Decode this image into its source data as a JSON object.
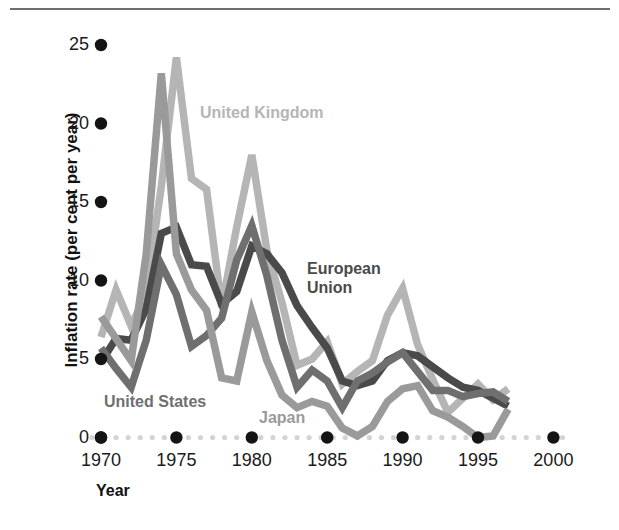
{
  "figure": {
    "top_rule": true,
    "background": "#ffffff"
  },
  "axes": {
    "ylabel": "Inflation rate (per cent per year)",
    "xlabel": "Year",
    "yticks": [
      0,
      5,
      10,
      15,
      20,
      25
    ],
    "xticks": [
      1970,
      1975,
      1980,
      1985,
      1990,
      1995,
      2000
    ],
    "ylim": [
      0,
      27.5
    ],
    "xlim": [
      1969.3,
      2001.5
    ],
    "tick_dot_color": "#141414",
    "minor_dot_color": "#d4d4d4"
  },
  "series_labels": [
    {
      "name": "united-kingdom",
      "text": "United Kingdom",
      "color": "#b5b5b5",
      "x": 200,
      "y": 103
    },
    {
      "name": "european-union",
      "text": "European\nUnion",
      "color": "#4a4a4a",
      "x": 307,
      "y": 259
    },
    {
      "name": "united-states",
      "text": "United States",
      "color": "#6f6f6f",
      "x": 104,
      "y": 392
    },
    {
      "name": "japan",
      "text": "Japan",
      "color": "#9a9a9a",
      "x": 259,
      "y": 408
    }
  ],
  "chart_data": {
    "type": "line",
    "title": "",
    "xlabel": "Year",
    "ylabel": "Inflation rate (per cent per year)",
    "xlim": [
      1969.3,
      2001.5
    ],
    "ylim": [
      0,
      27.5
    ],
    "xticks": [
      1970,
      1975,
      1980,
      1985,
      1990,
      1995,
      2000
    ],
    "yticks": [
      0,
      5,
      10,
      15,
      20,
      25
    ],
    "grid": false,
    "legend": "inline-annotations",
    "x": [
      1970,
      1971,
      1972,
      1973,
      1974,
      1975,
      1976,
      1977,
      1978,
      1979,
      1980,
      1981,
      1982,
      1983,
      1984,
      1985,
      1986,
      1987,
      1988,
      1989,
      1990,
      1991,
      1992,
      1993,
      1994,
      1995,
      1996,
      1997
    ],
    "series": [
      {
        "name": "United Kingdom",
        "color": "#b5b5b5",
        "values": [
          6.4,
          9.4,
          7.1,
          9.2,
          16.0,
          24.2,
          16.5,
          15.8,
          8.3,
          13.4,
          18.0,
          11.9,
          8.6,
          4.6,
          5.0,
          6.1,
          3.4,
          4.2,
          4.9,
          7.8,
          9.5,
          5.9,
          3.7,
          1.6,
          2.5,
          3.4,
          2.4,
          3.1
        ]
      },
      {
        "name": "European Union",
        "color": "#4a4a4a",
        "values": [
          4.8,
          6.3,
          6.2,
          8.2,
          13.0,
          13.4,
          11.0,
          10.9,
          8.5,
          9.3,
          12.2,
          11.7,
          10.5,
          8.4,
          7.0,
          5.7,
          3.6,
          3.3,
          3.6,
          4.9,
          5.4,
          5.2,
          4.5,
          3.8,
          3.2,
          3.0,
          2.5,
          2.0
        ]
      },
      {
        "name": "United States",
        "color": "#6f6f6f",
        "values": [
          5.7,
          4.4,
          3.2,
          6.2,
          11.0,
          9.1,
          5.8,
          6.5,
          7.6,
          11.3,
          13.5,
          10.3,
          6.2,
          3.2,
          4.3,
          3.6,
          1.9,
          3.6,
          4.1,
          4.8,
          5.4,
          4.2,
          3.0,
          3.0,
          2.6,
          2.8,
          2.9,
          2.3
        ]
      },
      {
        "name": "Japan",
        "color": "#9a9a9a",
        "values": [
          7.7,
          6.3,
          4.9,
          11.7,
          23.2,
          11.7,
          9.4,
          8.1,
          3.8,
          3.6,
          8.0,
          4.9,
          2.7,
          1.9,
          2.3,
          2.0,
          0.6,
          0.1,
          0.7,
          2.3,
          3.1,
          3.3,
          1.7,
          1.3,
          0.7,
          -0.1,
          0.1,
          1.8
        ]
      }
    ]
  }
}
